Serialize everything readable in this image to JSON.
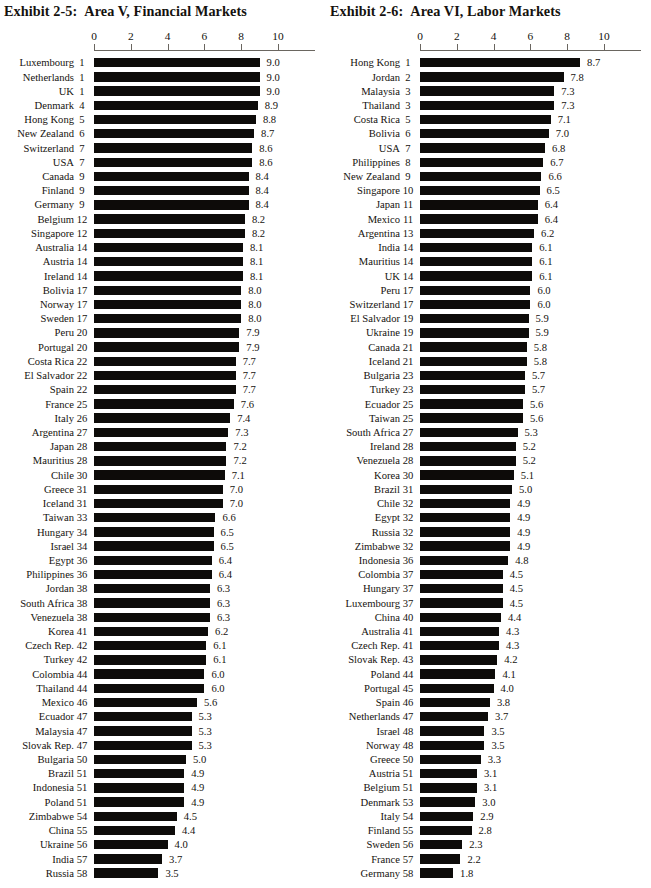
{
  "page": {
    "width": 651,
    "height": 888,
    "background": "#ffffff",
    "bar_color": "#0d0b09",
    "axis_color": "#6a6660"
  },
  "panels": [
    {
      "id": "exhibit-2-5",
      "title_number": "Exhibit 2-5:",
      "title_text": "Area V, Financial Markets",
      "chart_data": {
        "type": "bar",
        "orientation": "horizontal",
        "title": "Exhibit 2-5:  Area V, Financial Markets",
        "xlabel": "",
        "ylabel": "",
        "xlim": [
          0,
          10
        ],
        "xticks": [
          0,
          2,
          4,
          6,
          8,
          10
        ],
        "grid": false,
        "legend": false,
        "categories": [
          "Luxembourg",
          "Netherlands",
          "UK",
          "Denmark",
          "Hong Kong",
          "New Zealand",
          "Switzerland",
          "USA",
          "Canada",
          "Finland",
          "Germany",
          "Belgium",
          "Singapore",
          "Australia",
          "Austria",
          "Ireland",
          "Bolivia",
          "Norway",
          "Sweden",
          "Peru",
          "Portugal",
          "Costa Rica",
          "El Salvador",
          "Spain",
          "France",
          "Italy",
          "Argentina",
          "Japan",
          "Mauritius",
          "Chile",
          "Greece",
          "Iceland",
          "Taiwan",
          "Hungary",
          "Israel",
          "Egypt",
          "Philippines",
          "Jordan",
          "South Africa",
          "Venezuela",
          "Korea",
          "Czech Rep.",
          "Turkey",
          "Colombia",
          "Thailand",
          "Mexico",
          "Ecuador",
          "Malaysia",
          "Slovak Rep.",
          "Bulgaria",
          "Brazil",
          "Indonesia",
          "Poland",
          "Zimbabwe",
          "China",
          "Ukraine",
          "India",
          "Russia"
        ],
        "ranks": [
          1,
          1,
          1,
          4,
          5,
          6,
          7,
          7,
          9,
          9,
          9,
          12,
          12,
          14,
          14,
          14,
          17,
          17,
          17,
          20,
          20,
          22,
          22,
          22,
          25,
          26,
          27,
          28,
          28,
          30,
          31,
          31,
          33,
          34,
          34,
          36,
          36,
          38,
          38,
          38,
          41,
          42,
          42,
          44,
          44,
          46,
          47,
          47,
          47,
          50,
          51,
          51,
          51,
          54,
          55,
          56,
          57,
          58
        ],
        "values": [
          9.0,
          9.0,
          9.0,
          8.9,
          8.8,
          8.7,
          8.6,
          8.6,
          8.4,
          8.4,
          8.4,
          8.2,
          8.2,
          8.1,
          8.1,
          8.1,
          8.0,
          8.0,
          8.0,
          7.9,
          7.9,
          7.7,
          7.7,
          7.7,
          7.6,
          7.4,
          7.3,
          7.2,
          7.2,
          7.1,
          7.0,
          7.0,
          6.6,
          6.5,
          6.5,
          6.4,
          6.4,
          6.3,
          6.3,
          6.3,
          6.2,
          6.1,
          6.1,
          6.0,
          6.0,
          5.6,
          5.3,
          5.3,
          5.3,
          5.0,
          4.9,
          4.9,
          4.9,
          4.5,
          4.4,
          4.0,
          3.7,
          3.5
        ],
        "value_labels": [
          "9.0",
          "9.0",
          "9.0",
          "8.9",
          "8.8",
          "8.7",
          "8.6",
          "8.6",
          "8.4",
          "8.4",
          "8.4",
          "8.2",
          "8.2",
          "8.1",
          "8.1",
          "8.1",
          "8.0",
          "8.0",
          "8.0",
          "7.9",
          "7.9",
          "7.7",
          "7.7",
          "7.7",
          "7.6",
          "7.4",
          "7.3",
          "7.2",
          "7.2",
          "7.1",
          "7.0",
          "7.0",
          "6.6",
          "6.5",
          "6.5",
          "6.4",
          "6.4",
          "6.3",
          "6.3",
          "6.3",
          "6.2",
          "6.1",
          "6.1",
          "6.0",
          "6.0",
          "5.6",
          "5.3",
          "5.3",
          "5.3",
          "5.0",
          "4.9",
          "4.9",
          "4.9",
          "4.5",
          "4.4",
          "4.0",
          "3.7",
          "3.5"
        ]
      }
    },
    {
      "id": "exhibit-2-6",
      "title_number": "Exhibit 2-6:",
      "title_text": "Area VI, Labor Markets",
      "chart_data": {
        "type": "bar",
        "orientation": "horizontal",
        "title": "Exhibit 2-6:  Area VI, Labor Markets",
        "xlabel": "",
        "ylabel": "",
        "xlim": [
          0,
          10
        ],
        "xticks": [
          0,
          2,
          4,
          6,
          8,
          10
        ],
        "grid": false,
        "legend": false,
        "categories": [
          "Hong Kong",
          "Jordan",
          "Malaysia",
          "Thailand",
          "Costa Rica",
          "Bolivia",
          "USA",
          "Philippines",
          "New Zealand",
          "Singapore",
          "Japan",
          "Mexico",
          "Argentina",
          "India",
          "Mauritius",
          "UK",
          "Peru",
          "Switzerland",
          "El Salvador",
          "Ukraine",
          "Canada",
          "Iceland",
          "Bulgaria",
          "Turkey",
          "Ecuador",
          "Taiwan",
          "South Africa",
          "Ireland",
          "Venezuela",
          "Korea",
          "Brazil",
          "Chile",
          "Egypt",
          "Russia",
          "Zimbabwe",
          "Indonesia",
          "Colombia",
          "Hungary",
          "Luxembourg",
          "China",
          "Australia",
          "Czech Rep.",
          "Slovak Rep.",
          "Poland",
          "Portugal",
          "Spain",
          "Netherlands",
          "Israel",
          "Norway",
          "Greece",
          "Austria",
          "Belgium",
          "Denmark",
          "Italy",
          "Finland",
          "Sweden",
          "France",
          "Germany"
        ],
        "ranks": [
          1,
          2,
          3,
          3,
          5,
          6,
          7,
          8,
          9,
          10,
          11,
          11,
          13,
          14,
          14,
          14,
          17,
          17,
          19,
          19,
          21,
          21,
          23,
          23,
          25,
          25,
          27,
          28,
          28,
          30,
          31,
          32,
          32,
          32,
          32,
          36,
          37,
          37,
          37,
          40,
          41,
          41,
          43,
          44,
          45,
          46,
          47,
          48,
          48,
          50,
          51,
          51,
          53,
          54,
          55,
          56,
          57,
          58
        ],
        "values": [
          8.7,
          7.8,
          7.3,
          7.3,
          7.1,
          7.0,
          6.8,
          6.7,
          6.6,
          6.5,
          6.4,
          6.4,
          6.2,
          6.1,
          6.1,
          6.1,
          6.0,
          6.0,
          5.9,
          5.9,
          5.8,
          5.8,
          5.7,
          5.7,
          5.6,
          5.6,
          5.3,
          5.2,
          5.2,
          5.1,
          5.0,
          4.9,
          4.9,
          4.9,
          4.9,
          4.8,
          4.5,
          4.5,
          4.5,
          4.4,
          4.3,
          4.3,
          4.2,
          4.1,
          4.0,
          3.8,
          3.7,
          3.5,
          3.5,
          3.3,
          3.1,
          3.1,
          3.0,
          2.9,
          2.8,
          2.3,
          2.2,
          1.8
        ],
        "value_labels": [
          "8.7",
          "7.8",
          "7.3",
          "7.3",
          "7.1",
          "7.0",
          "6.8",
          "6.7",
          "6.6",
          "6.5",
          "6.4",
          "6.4",
          "6.2",
          "6.1",
          "6.1",
          "6.1",
          "6.0",
          "6.0",
          "5.9",
          "5.9",
          "5.8",
          "5.8",
          "5.7",
          "5.7",
          "5.6",
          "5.6",
          "5.3",
          "5.2",
          "5.2",
          "5.1",
          "5.0",
          "4.9",
          "4.9",
          "4.9",
          "4.9",
          "4.8",
          "4.5",
          "4.5",
          "4.5",
          "4.4",
          "4.3",
          "4.3",
          "4.2",
          "4.1",
          "4.0",
          "3.8",
          "3.7",
          "3.5",
          "3.5",
          "3.3",
          "3.1",
          "3.1",
          "3.0",
          "2.9",
          "2.8",
          "2.3",
          "2.2",
          "1.8"
        ]
      }
    }
  ],
  "axis": {
    "tick_labels": [
      "0",
      "2",
      "4",
      "6",
      "8",
      "10"
    ]
  }
}
